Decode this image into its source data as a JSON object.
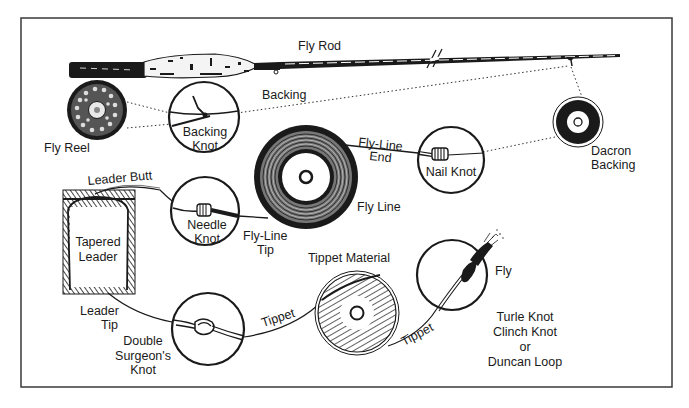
{
  "diagram": {
    "colors": {
      "ink": "#1a1a1a",
      "paper": "#ffffff",
      "frame": "#3a3a3a"
    },
    "components": {
      "fly_rod": "Fly Rod",
      "fly_reel": "Fly Reel",
      "backing": "Backing",
      "backing_knot_1": "Backing",
      "backing_knot_2": "Knot",
      "dacron_backing_1": "Dacron",
      "dacron_backing_2": "Backing",
      "fly_line_end_1": "Fly-Line",
      "fly_line_end_2": "End",
      "nail_knot": "Nail Knot",
      "fly_line": "Fly Line",
      "leader_butt": "Leader Butt",
      "needle_knot_1": "Needle",
      "needle_knot_2": "Knot",
      "fly_line_tip_1": "Fly-Line",
      "fly_line_tip_2": "Tip",
      "tapered_leader_1": "Tapered",
      "tapered_leader_2": "Leader",
      "leader_tip_1": "Leader",
      "leader_tip_2": "Tip",
      "tippet_material": "Tippet Material",
      "tippet_left": "Tippet",
      "tippet_right": "Tippet",
      "double_surgeons_1": "Double",
      "double_surgeons_2": "Surgeon's",
      "double_surgeons_3": "Knot",
      "fly": "Fly",
      "fly_knots_1": "Turle Knot",
      "fly_knots_2": "Clinch Knot",
      "fly_knots_3": "or",
      "fly_knots_4": "Duncan Loop"
    }
  }
}
